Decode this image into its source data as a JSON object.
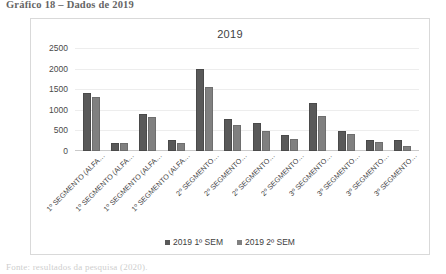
{
  "document": {
    "caption_top": "Gráfico 18 – Dados de 2019",
    "caption_bottom": "Fonte: resultados da pesquisa (2020)."
  },
  "colors": {
    "series1": "#595959",
    "series2": "#808080",
    "gridline": "#ededed",
    "frame_border": "#d9d9d9",
    "plot_background": "#ffffff"
  },
  "legend": {
    "position": "bottom-center",
    "items": [
      {
        "label": "2019 1º SEM",
        "color": "#595959"
      },
      {
        "label": "2019 2º SEM",
        "color": "#808080"
      }
    ]
  },
  "chart_data": {
    "type": "bar",
    "title": "2019",
    "xlabel": "",
    "ylabel": "",
    "ylim": [
      0,
      2500
    ],
    "yticks": [
      2500,
      2000,
      1500,
      1000,
      500,
      0
    ],
    "ytick_labels": [
      "2500",
      "2000",
      "1500",
      "1000",
      "500",
      "0"
    ],
    "grid": true,
    "grouped": true,
    "categories": [
      "1º SEGMENTO (ALFA…",
      "1º SEGMENTO (ALFA…",
      "1º SEGMENTO (ALFA…",
      "1º SEGMENTO (ALFA…",
      "2º SEGMENTO…",
      "2º SEGMENTO…",
      "2º SEGMENTO…",
      "2º SEGMENTO…",
      "3º SEGMENTO…",
      "3º SEGMENTO…",
      "3º SEGMENTO…",
      "3º SEGMENTO…"
    ],
    "series": [
      {
        "name": "2019 1º SEM",
        "color": "#595959",
        "values": [
          1400,
          200,
          900,
          260,
          2000,
          780,
          680,
          380,
          1170,
          480,
          270,
          270
        ]
      },
      {
        "name": "2019 2º SEM",
        "color": "#808080",
        "values": [
          1300,
          200,
          820,
          200,
          1550,
          620,
          480,
          300,
          840,
          420,
          230,
          130
        ]
      }
    ]
  }
}
